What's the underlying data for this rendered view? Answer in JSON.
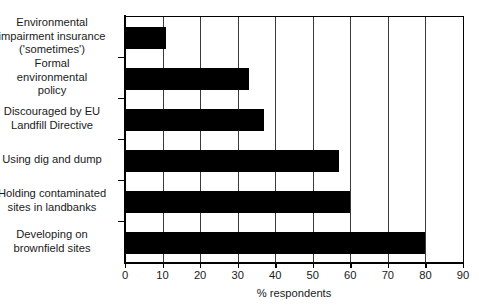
{
  "chart_data": {
    "type": "bar",
    "orientation": "horizontal",
    "title": "",
    "xlabel": "% respondents",
    "ylabel": "",
    "xlim": [
      0,
      90
    ],
    "xticks": [
      0,
      10,
      20,
      30,
      40,
      50,
      60,
      70,
      80,
      90
    ],
    "grid": "vertical",
    "legend": "none",
    "bar_color": "#000000",
    "categories": [
      "Environmental\nimpairment insurance\n('sometimes')",
      "Formal\nenvironmental\npolicy",
      "Discouraged by EU\nLandfill Directive",
      "Using dig and dump",
      "Holding contaminated\nsites in landbanks",
      "Developing on\nbrownfield sites"
    ],
    "values": [
      11,
      33,
      37,
      57,
      60,
      80
    ]
  }
}
